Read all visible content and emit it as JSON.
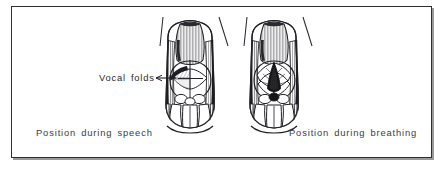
{
  "figure": {
    "frame": {
      "border_color": "#2e2e33",
      "background": "#ffffff",
      "shadow_color": "#46464e"
    },
    "ink_color": "#1f1f24",
    "fill_dark": "#17171b",
    "fill_light": "#ffffff"
  },
  "annotations": {
    "vocal_folds_label": "Vocal  folds",
    "leader_arrow": "arrow-right"
  },
  "captions": {
    "left": "Position  during  speech",
    "right": "Position  during  breathing"
  },
  "illustrations": [
    {
      "id": "larynx-speech",
      "position": "left",
      "state": "adducted",
      "glottis_opening": "closed",
      "caption_ref": "captions.left"
    },
    {
      "id": "larynx-breathing",
      "position": "right",
      "state": "abducted",
      "glottis_opening": "open-triangular-dark",
      "caption_ref": "captions.right"
    }
  ]
}
